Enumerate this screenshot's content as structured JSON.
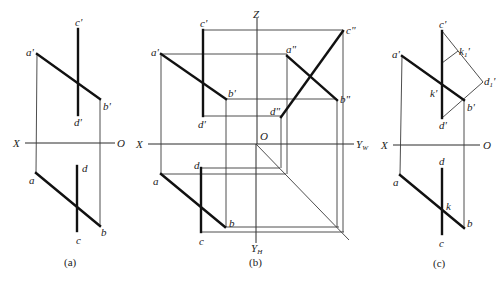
{
  "figure": {
    "panels": [
      {
        "id": "a",
        "caption": "(a)",
        "axis_labels": {
          "x": "X",
          "o": "O"
        },
        "point_labels": {
          "a1": "a'",
          "b1": "b'",
          "c1": "c'",
          "d1": "d'",
          "a": "a",
          "b": "b",
          "c": "c",
          "d": "d"
        }
      },
      {
        "id": "b",
        "caption": "(b)",
        "axis_labels": {
          "x": "X",
          "o": "O",
          "z": "Z",
          "yw": "Y",
          "yw_sub": "W",
          "yh": "Y",
          "yh_sub": "H"
        },
        "point_labels": {
          "a1": "a'",
          "b1": "b'",
          "c1": "c'",
          "d1": "d'",
          "a2": "a\"",
          "b2": "b\"",
          "c2": "c\"",
          "d2": "d\"",
          "a": "a",
          "b": "b",
          "c": "c",
          "d": "d"
        }
      },
      {
        "id": "c",
        "caption": "(c)",
        "axis_labels": {
          "x": "X",
          "o": "O"
        },
        "point_labels": {
          "a1": "a'",
          "b1": "b'",
          "c1": "c'",
          "d1": "d'",
          "k1": "k'",
          "k11": "k",
          "k11_sub": "1",
          "k11_prime": "'",
          "d11": "d",
          "d11_sub": "1",
          "d11_prime": "'",
          "a": "a",
          "b": "b",
          "c": "c",
          "d": "d",
          "k": "k"
        }
      }
    ]
  }
}
